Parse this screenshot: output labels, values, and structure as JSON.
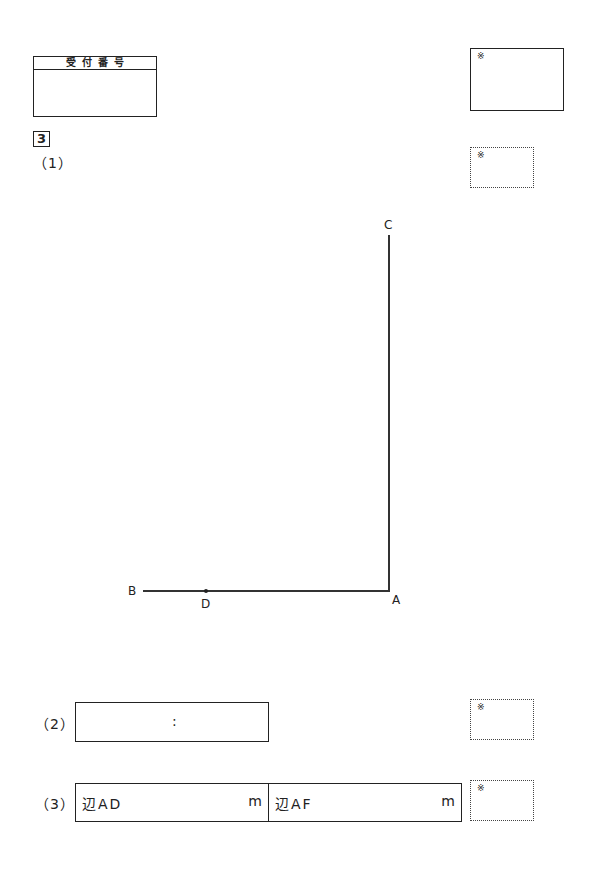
{
  "reception": {
    "header": "受付番号",
    "value": ""
  },
  "question_number": "3",
  "score_mark": "※",
  "parts": {
    "p1": {
      "label": "（1）"
    },
    "p2": {
      "label": "（2）",
      "separator": ":"
    },
    "p3": {
      "label": "（3）",
      "fields": [
        {
          "label": "辺AD",
          "unit": "m",
          "value": ""
        },
        {
          "label": "辺AF",
          "unit": "m",
          "value": ""
        }
      ]
    }
  },
  "figure": {
    "points": [
      {
        "name": "C",
        "x": 389,
        "y": 232
      },
      {
        "name": "A",
        "x": 389,
        "y": 591
      },
      {
        "name": "B",
        "x": 143,
        "y": 591
      },
      {
        "name": "D",
        "x": 206,
        "y": 591
      }
    ],
    "segments": [
      [
        "A",
        "C"
      ],
      [
        "B",
        "A"
      ]
    ]
  }
}
